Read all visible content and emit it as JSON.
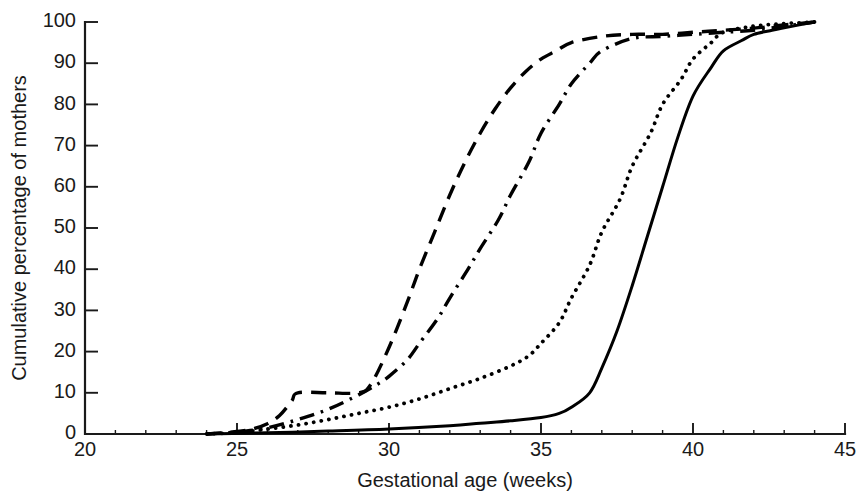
{
  "figure": {
    "background_color": "#ffffff",
    "ink_color": "#000000"
  },
  "chart_data": {
    "type": "line",
    "title": "",
    "subtitle": "",
    "xlabel": "Gestational age (weeks)",
    "ylabel": "Cumulative percentage of mothers",
    "xlim": [
      20,
      45
    ],
    "ylim": [
      0,
      100
    ],
    "xticks": [
      20,
      25,
      30,
      35,
      40,
      45
    ],
    "xtick_labels": [
      "20",
      "25",
      "30",
      "35",
      "40",
      "45"
    ],
    "xtick_minor_step": 1,
    "yticks": [
      0,
      10,
      20,
      30,
      40,
      50,
      60,
      70,
      80,
      90,
      100
    ],
    "ytick_labels": [
      "0",
      "10",
      "20",
      "30",
      "40",
      "50",
      "60",
      "70",
      "80",
      "90",
      "100"
    ],
    "grid": false,
    "legend": "none",
    "legend_position": "none",
    "annotations": [],
    "spines": [
      "left",
      "bottom"
    ],
    "tick_direction": "in",
    "series": [
      {
        "name": "Series 1",
        "style": "dashed",
        "dash_pattern": "long-dash",
        "color": "#000000",
        "x": [
          24,
          25,
          25.5,
          26,
          26.4,
          26.8,
          27,
          28,
          29,
          29.4,
          30,
          30.6,
          31,
          31.5,
          32,
          32.5,
          33,
          33.5,
          34,
          34.5,
          35,
          35.5,
          36,
          37,
          38,
          39,
          40,
          41,
          42,
          43,
          44
        ],
        "values": [
          0,
          0.6,
          1.2,
          2.5,
          4.5,
          8,
          10,
          10,
          10,
          12,
          21,
          32,
          40,
          49,
          58,
          66,
          73,
          79,
          84,
          88,
          91,
          93,
          95,
          96.5,
          97,
          97,
          97.5,
          98,
          98.5,
          99.3,
          100
        ]
      },
      {
        "name": "Series 2",
        "style": "dash-dot",
        "dash_pattern": "dash-dot",
        "color": "#000000",
        "x": [
          24,
          25,
          26,
          27,
          28,
          29,
          29.6,
          30,
          30.6,
          31,
          31.6,
          32,
          32.6,
          33,
          33.6,
          34,
          34.6,
          35,
          35.6,
          36,
          36.6,
          37,
          38,
          39,
          40,
          41,
          42,
          43,
          44
        ],
        "values": [
          0,
          0.5,
          1.5,
          3.5,
          6,
          9.5,
          12,
          14,
          18,
          22,
          28,
          33,
          40,
          45,
          52,
          58,
          66,
          73,
          80,
          85,
          90,
          93,
          96,
          96.5,
          97,
          97.5,
          98,
          99,
          100
        ]
      },
      {
        "name": "Series 3",
        "style": "dotted",
        "dash_pattern": "dotted",
        "color": "#000000",
        "x": [
          24,
          25,
          26,
          27,
          28,
          29,
          30,
          31,
          32,
          33,
          34,
          34.6,
          35,
          35.6,
          36,
          36.6,
          37,
          37.6,
          38,
          38.6,
          39,
          39.6,
          40,
          40.6,
          41,
          42,
          43,
          44
        ],
        "values": [
          0,
          0.4,
          1.2,
          2.2,
          3.5,
          5,
          6.5,
          8.5,
          11,
          13.5,
          16.5,
          19,
          22,
          27,
          33,
          41,
          49,
          57,
          65,
          73,
          80,
          86,
          91,
          95,
          97.5,
          99,
          99.6,
          100
        ]
      },
      {
        "name": "Series 4",
        "style": "solid",
        "dash_pattern": "solid",
        "color": "#000000",
        "x": [
          24,
          26,
          28,
          30,
          32,
          33,
          34,
          35,
          35.6,
          36,
          36.6,
          37,
          37.5,
          38,
          38.5,
          39,
          39.5,
          40,
          40.6,
          41,
          41.6,
          42,
          42.6,
          43,
          43.5,
          44
        ],
        "values": [
          0,
          0.3,
          0.7,
          1.2,
          2,
          2.6,
          3.2,
          4,
          5,
          6.5,
          10,
          16,
          25,
          36,
          48,
          60,
          72,
          82,
          89,
          93,
          95.5,
          97,
          98,
          98.6,
          99.3,
          100
        ]
      }
    ]
  }
}
